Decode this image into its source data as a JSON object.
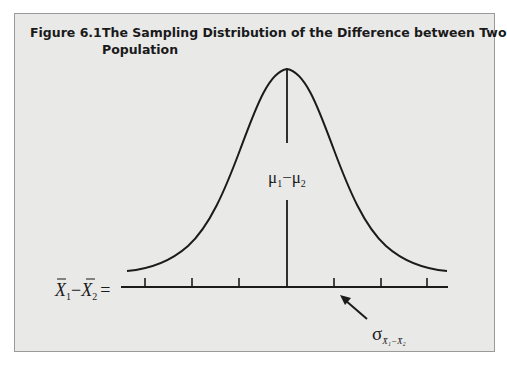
{
  "figure": {
    "number": "Figure 6.1",
    "title_line1": "The Sampling Distribution of the Difference between Two",
    "title_line2": "Population"
  },
  "diagram": {
    "type": "normal-distribution",
    "center_label": "μ₁ − μ₂",
    "center_label_parts": {
      "mu1": "μ",
      "sub1": "1",
      "minus": "−",
      "mu2": "μ",
      "sub2": "2"
    },
    "axis_label": "X̄₁ − X̄₂ =",
    "axis_label_parts": {
      "x1": "X",
      "sub1": "1",
      "minus": "−",
      "x2": "X",
      "sub2": "2",
      "eq": "="
    },
    "sigma_label": "σ",
    "sigma_subscript": "X̄₁−X̄₂",
    "tick_count": 7,
    "arrow_target": "tick between center and +2σ"
  }
}
